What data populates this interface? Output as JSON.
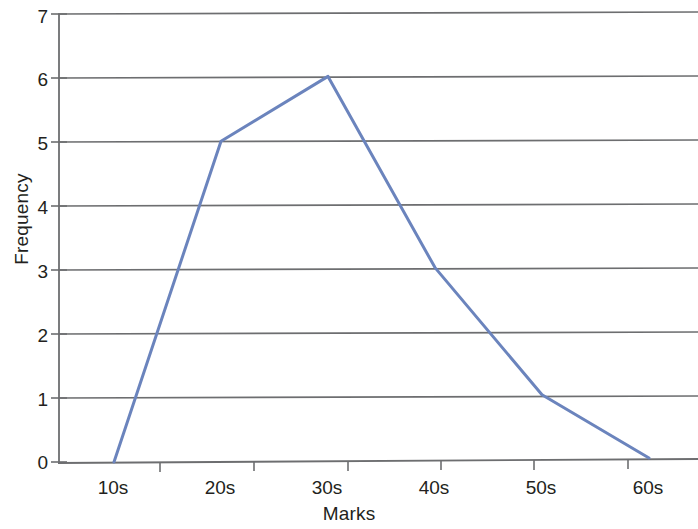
{
  "chart_data": {
    "type": "line",
    "title": "",
    "subtitle": "",
    "xlabel": "Marks",
    "ylabel": "Frequency",
    "categories": [
      "10s",
      "20s",
      "30s",
      "40s",
      "50s",
      "60s"
    ],
    "x": [
      10,
      20,
      30,
      40,
      50,
      60
    ],
    "values": [
      0,
      5,
      6,
      3,
      1,
      0
    ],
    "series": [
      {
        "name": "Frequency",
        "values": [
          0,
          5,
          6,
          3,
          1,
          0
        ],
        "color": "#6b84bd"
      }
    ],
    "ylim": [
      0,
      7
    ],
    "yticks": [
      0,
      1,
      2,
      3,
      4,
      5,
      6,
      7
    ],
    "ytick_labels": [
      "0",
      "1",
      "2",
      "3",
      "4",
      "5",
      "6",
      "7"
    ],
    "xtick_labels": [
      "10s",
      "20s",
      "30s",
      "40s",
      "50s",
      "60s"
    ],
    "grid": "horizontal",
    "legend": "none",
    "annotations": [],
    "line_color": "#6b84bd",
    "grid_color": "#6d6e70",
    "axis_color": "#6d6e70"
  },
  "axes": {
    "y_title": "Frequency",
    "x_title": "Marks"
  }
}
